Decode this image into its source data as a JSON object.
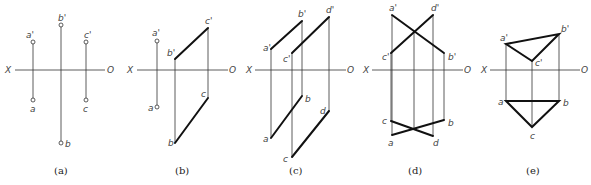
{
  "panels": [
    {
      "id": "a",
      "caption": "(a)",
      "axis": {
        "x_label": "X",
        "o_label": "O",
        "y": 70,
        "x1": 15,
        "x2": 105,
        "xl": 9,
        "ol": 110
      },
      "points": [
        {
          "label": "a'",
          "x": 33,
          "y": 42
        },
        {
          "label": "a",
          "x": 33,
          "y": 100
        },
        {
          "label": "b'",
          "x": 61,
          "y": 25
        },
        {
          "label": "b",
          "x": 61,
          "y": 143
        },
        {
          "label": "c'",
          "x": 86,
          "y": 42
        },
        {
          "label": "c",
          "x": 86,
          "y": 100
        }
      ]
    },
    {
      "id": "b",
      "caption": "(b)",
      "axis": {
        "x_label": "X",
        "o_label": "O",
        "y": 70,
        "x1": 137,
        "x2": 228,
        "xl": 130,
        "ol": 231
      },
      "points": [
        {
          "label": "a'",
          "x": 157,
          "y": 41
        },
        {
          "label": "a",
          "x": 157,
          "y": 107
        },
        {
          "label": "b'",
          "x": 175,
          "y": 59
        },
        {
          "label": "b",
          "x": 175,
          "y": 143
        },
        {
          "label": "c'",
          "x": 208,
          "y": 28
        },
        {
          "label": "c",
          "x": 208,
          "y": 98
        }
      ]
    },
    {
      "id": "c",
      "caption": "(c)",
      "axis": {
        "x_label": "X",
        "o_label": "O",
        "y": 70,
        "x1": 255,
        "x2": 346,
        "xl": 249,
        "ol": 349
      },
      "points": [
        {
          "label": "a'",
          "x": 271,
          "y": 49
        },
        {
          "label": "a",
          "x": 271,
          "y": 138
        },
        {
          "label": "b'",
          "x": 302,
          "y": 21
        },
        {
          "label": "b",
          "x": 302,
          "y": 96
        },
        {
          "label": "c'",
          "x": 292,
          "y": 53
        },
        {
          "label": "c",
          "x": 292,
          "y": 157
        },
        {
          "label": "d'",
          "x": 329,
          "y": 17
        },
        {
          "label": "d",
          "x": 329,
          "y": 111
        }
      ]
    },
    {
      "id": "d",
      "caption": "(d)",
      "axis": {
        "x_label": "X",
        "o_label": "O",
        "y": 70,
        "x1": 372,
        "x2": 463,
        "xl": 367,
        "ol": 466
      },
      "points": [
        {
          "label": "a'",
          "x": 392,
          "y": 15
        },
        {
          "label": "a",
          "x": 392,
          "y": 135
        },
        {
          "label": "d'",
          "x": 433,
          "y": 15
        },
        {
          "label": "d",
          "x": 433,
          "y": 136
        },
        {
          "label": "c'",
          "x": 391,
          "y": 53
        },
        {
          "label": "c",
          "x": 391,
          "y": 121
        },
        {
          "label": "b'",
          "x": 444,
          "y": 53
        },
        {
          "label": "b",
          "x": 444,
          "y": 120
        }
      ]
    },
    {
      "id": "e",
      "caption": "(e)",
      "axis": {
        "x_label": "X",
        "o_label": "O",
        "y": 70,
        "x1": 490,
        "x2": 580,
        "xl": 484,
        "ol": 583
      },
      "points": [
        {
          "label": "a'",
          "x": 506,
          "y": 44
        },
        {
          "label": "b'",
          "x": 559,
          "y": 34
        },
        {
          "label": "c'",
          "x": 532,
          "y": 61
        },
        {
          "label": "a",
          "x": 506,
          "y": 101
        },
        {
          "label": "b",
          "x": 559,
          "y": 101
        },
        {
          "label": "c",
          "x": 532,
          "y": 127
        }
      ]
    }
  ]
}
